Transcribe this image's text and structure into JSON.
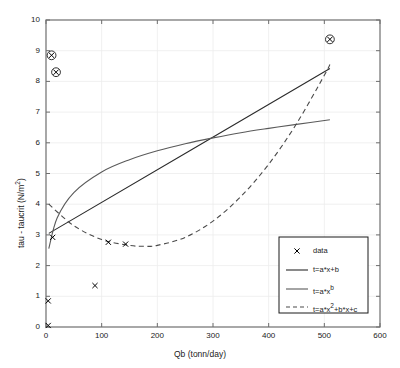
{
  "chart_data": {
    "type": "scatter",
    "title": "",
    "xlabel": "Qb (tonn/day)",
    "ylabel": "tau - taucrit (N/m2)",
    "ylabel_display": "tau - taucrit (N/m²)",
    "xlim": [
      0,
      600
    ],
    "ylim": [
      0,
      10
    ],
    "xticks": [
      0,
      100,
      200,
      300,
      400,
      500,
      600
    ],
    "yticks": [
      0,
      1,
      2,
      3,
      4,
      5,
      6,
      7,
      8,
      9,
      10
    ],
    "grid": true,
    "legend_position": "lower right",
    "series": [
      {
        "name": "data",
        "type": "scatter",
        "marker": "x",
        "color": "#000000",
        "points": [
          {
            "x": 4,
            "y": 0.05
          },
          {
            "x": 4,
            "y": 0.85
          },
          {
            "x": 10,
            "y": 8.85
          },
          {
            "x": 18,
            "y": 8.3
          },
          {
            "x": 12,
            "y": 2.92
          },
          {
            "x": 88,
            "y": 1.35
          },
          {
            "x": 112,
            "y": 2.76
          },
          {
            "x": 143,
            "y": 2.7
          },
          {
            "x": 510,
            "y": 9.37
          }
        ]
      },
      {
        "name": "t=a*x+b",
        "type": "line",
        "style": "solid",
        "color": "#2b2b2b",
        "x": [
          5,
          510
        ],
        "y": [
          3.05,
          8.42
        ]
      },
      {
        "name": "t=a*x^b",
        "type": "line",
        "style": "solid",
        "color": "#5a5a5a",
        "x": [
          5,
          20,
          50,
          100,
          150,
          200,
          250,
          300,
          350,
          400,
          450,
          510
        ],
        "y": [
          2.55,
          3.55,
          4.38,
          5.05,
          5.45,
          5.74,
          5.97,
          6.16,
          6.33,
          6.47,
          6.6,
          6.75
        ]
      },
      {
        "name": "t=a*x2+b*x+c",
        "type": "line",
        "style": "dashed",
        "color": "#4a4a4a",
        "x": [
          5,
          50,
          100,
          150,
          175,
          200,
          250,
          300,
          350,
          400,
          450,
          500,
          510
        ],
        "y": [
          4.0,
          3.3,
          2.85,
          2.66,
          2.63,
          2.66,
          2.92,
          3.45,
          4.25,
          5.3,
          6.62,
          8.2,
          8.55
        ]
      }
    ],
    "legend": [
      {
        "label": "data",
        "marker": "x",
        "line": "none"
      },
      {
        "label": "t=a*x+b",
        "marker": "none",
        "line": "solid"
      },
      {
        "label": "t=a*x^b",
        "marker": "none",
        "line": "solid",
        "sup": "b",
        "base": "t=a*x"
      },
      {
        "label": "t=a*x^2+b*x+c",
        "marker": "none",
        "line": "dashed",
        "pre": "t=a*x",
        "sup": "2",
        "post": "+b*x+c"
      }
    ]
  }
}
